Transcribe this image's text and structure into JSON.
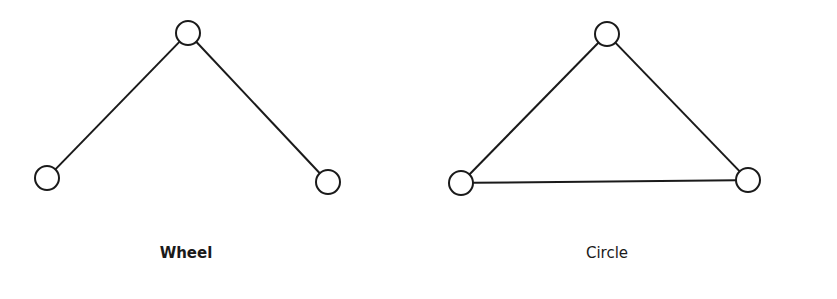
{
  "diagrams": [
    {
      "name": "Wheel",
      "label_x": 186,
      "label_y": 244,
      "nodes": [
        {
          "id": "top",
          "x": 188,
          "y": 33
        },
        {
          "id": "left",
          "x": 47,
          "y": 178
        },
        {
          "id": "right",
          "x": 328,
          "y": 182
        }
      ],
      "edges": [
        [
          "top",
          "left"
        ],
        [
          "top",
          "right"
        ]
      ]
    },
    {
      "name": "Circle",
      "label_x": 607,
      "label_y": 244,
      "nodes": [
        {
          "id": "top",
          "x": 607,
          "y": 34
        },
        {
          "id": "left",
          "x": 461,
          "y": 183
        },
        {
          "id": "right",
          "x": 748,
          "y": 180
        }
      ],
      "edges": [
        [
          "top",
          "left"
        ],
        [
          "top",
          "right"
        ],
        [
          "left",
          "right"
        ]
      ]
    }
  ],
  "style": {
    "stroke": "#1a1a1a",
    "node_radius": 12,
    "stroke_width": 2
  }
}
